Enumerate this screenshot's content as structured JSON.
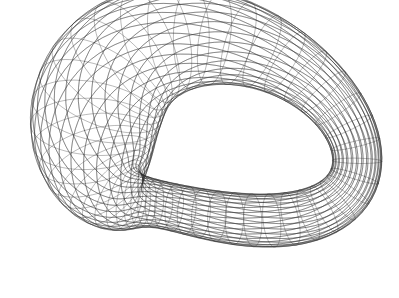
{
  "figure": {
    "description": "Wireframe rendering of a self-intersecting 3D tubular surface (Klein-bottle-like) drawn with thin gray mesh lines on white",
    "background": "#ffffff",
    "line_color": "#2a2a2a",
    "line_opacity": 0.55,
    "line_width": 0.6,
    "mesh": {
      "u_lines": 46,
      "v_lines": 30
    }
  }
}
